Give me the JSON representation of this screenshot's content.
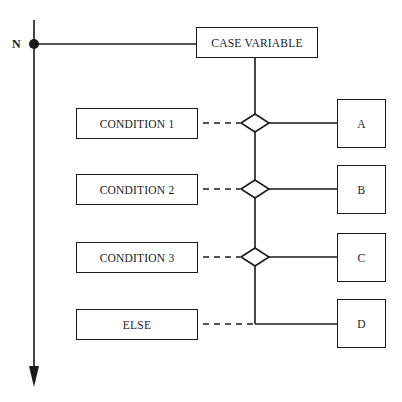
{
  "diagram": {
    "type": "case-structure flowchart",
    "timeline_label": "N",
    "case_variable": "CASE VARIABLE",
    "branches": [
      {
        "condition": "CONDITION 1",
        "outcome": "A"
      },
      {
        "condition": "CONDITION 2",
        "outcome": "B"
      },
      {
        "condition": "CONDITION 3",
        "outcome": "C"
      },
      {
        "condition": "ELSE",
        "outcome": "D"
      }
    ],
    "colors": {
      "stroke": "#1a1a1a",
      "background": "#ffffff"
    }
  }
}
